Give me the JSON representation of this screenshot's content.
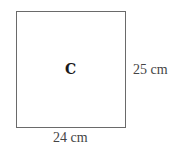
{
  "shape": {
    "type": "rectangle",
    "label": "C",
    "width_label": "24 cm",
    "height_label": "25 cm",
    "border_color": "#6a6a6a"
  }
}
